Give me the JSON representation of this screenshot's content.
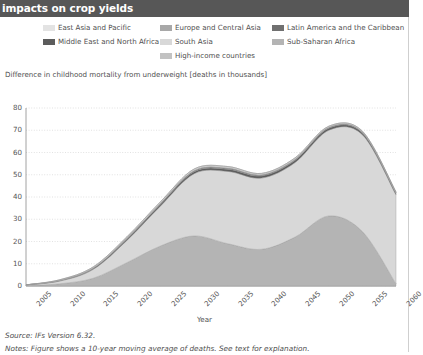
{
  "header": {
    "title": "impacts on crop yields"
  },
  "legend": {
    "columns": [
      {
        "items": [
          {
            "label": "East Asia and Pacific",
            "color": "#e3e3e3",
            "swatch_name": "legend-swatch-east-asia-and-pacific"
          },
          {
            "label": "Middle East and North Africa",
            "color": "#5c5c5c",
            "swatch_name": "legend-swatch-middle-east-and-north-africa"
          }
        ]
      },
      {
        "items": [
          {
            "label": "Europe and Central Asia",
            "color": "#a8a8a8",
            "swatch_name": "legend-swatch-europe-and-central-asia"
          },
          {
            "label": "South Asia",
            "color": "#d8d8d8",
            "swatch_name": "legend-swatch-south-asia"
          },
          {
            "label": "High-income countries",
            "color": "#c2c2c2",
            "swatch_name": "legend-swatch-high-income-countries"
          }
        ]
      },
      {
        "items": [
          {
            "label": "Latin America and the Caribbean",
            "color": "#707070",
            "swatch_name": "legend-swatch-latin-america-and-the-caribbean"
          },
          {
            "label": "Sub-Saharan Africa",
            "color": "#b4b4b4",
            "swatch_name": "legend-swatch-sub-saharan-africa"
          }
        ]
      }
    ]
  },
  "axes": {
    "y_title": "Difference in childhood mortality from underweight [deaths in thousands]",
    "x_title": "Year"
  },
  "footer": {
    "source": "Source: IFs Version 6.32.",
    "notes": "Notes: Figure shows a 10-year moving average of deaths. See text for explanation."
  },
  "chart_data": {
    "type": "area",
    "stacked": true,
    "title": "Difference in childhood mortality from underweight [deaths in thousands]",
    "xlabel": "Year",
    "ylabel": "Difference in childhood mortality from underweight [deaths in thousands]",
    "xlim": [
      2005,
      2060
    ],
    "ylim": [
      0,
      80
    ],
    "xticks": [
      2005,
      2010,
      2015,
      2020,
      2025,
      2030,
      2035,
      2040,
      2045,
      2050,
      2055,
      2060
    ],
    "yticks": [
      0,
      10,
      20,
      30,
      40,
      50,
      60,
      70,
      80
    ],
    "grid": true,
    "legend_position": "top",
    "x": [
      2005,
      2010,
      2015,
      2020,
      2025,
      2030,
      2035,
      2040,
      2045,
      2050,
      2055,
      2060
    ],
    "series": [
      {
        "name": "East Asia and Pacific",
        "color": "#e3e3e3",
        "values": [
          0.0,
          0.2,
          0.4,
          0.5,
          0.6,
          0.6,
          0.6,
          0.5,
          0.5,
          0.4,
          0.4,
          0.3
        ]
      },
      {
        "name": "Europe and Central Asia",
        "color": "#a8a8a8",
        "values": [
          0.0,
          0.1,
          0.1,
          0.2,
          0.2,
          0.2,
          0.2,
          0.2,
          0.2,
          0.2,
          0.1,
          0.1
        ]
      },
      {
        "name": "Latin America and the Caribbean",
        "color": "#707070",
        "values": [
          0.0,
          0.1,
          0.2,
          0.3,
          0.3,
          0.4,
          0.4,
          0.4,
          0.4,
          0.3,
          0.3,
          0.2
        ]
      },
      {
        "name": "Middle East and North Africa",
        "color": "#5c5c5c",
        "values": [
          0.0,
          0.2,
          0.4,
          0.6,
          0.8,
          0.9,
          1.0,
          1.0,
          1.0,
          0.9,
          0.8,
          0.7
        ]
      },
      {
        "name": "South Asia",
        "color": "#d8d8d8",
        "values": [
          0.3,
          1.2,
          4.0,
          10.0,
          18.0,
          28.0,
          32.5,
          32.0,
          33.5,
          38.5,
          43.5,
          40.0
        ]
      },
      {
        "name": "Sub-Saharan Africa",
        "color": "#b4b4b4",
        "values": [
          0.2,
          1.0,
          3.5,
          10.5,
          18.0,
          22.5,
          19.0,
          16.5,
          22.0,
          31.5,
          24.5,
          1.0
        ]
      },
      {
        "name": "High-income countries",
        "color": "#c2c2c2",
        "values": [
          0.0,
          0.0,
          0.0,
          0.0,
          0.0,
          0.0,
          0.0,
          0.0,
          0.0,
          0.0,
          0.0,
          0.0
        ]
      }
    ],
    "totals": [
      0.5,
      2.8,
      8.6,
      22.1,
      37.9,
      52.6,
      53.7,
      50.6,
      57.6,
      71.8,
      69.6,
      42.3
    ],
    "annotations": []
  }
}
